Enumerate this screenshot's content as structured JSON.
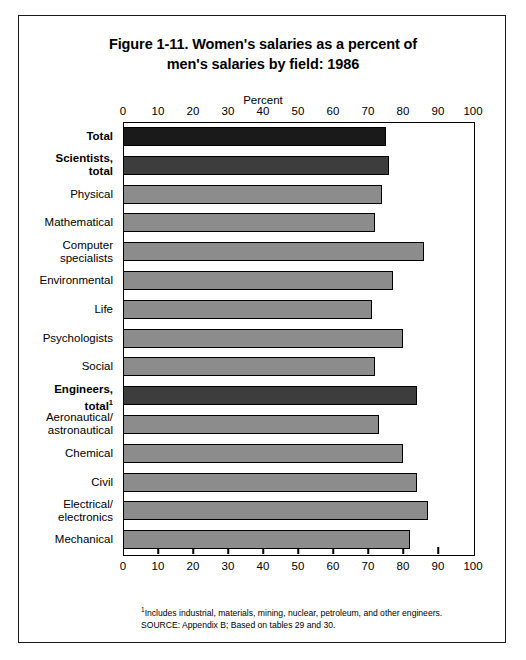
{
  "figure": {
    "title_line1": "Figure 1-11.  Women's salaries as a percent of",
    "title_line2": "men's salaries by field:  1986",
    "axis_caption": "Percent",
    "footnote_marker": "1",
    "footnote": "Includes industrial, materials, mining, nuclear, petroleum, and other engineers.",
    "source": "SOURCE:  Appendix B; Based on tables 29 and 30."
  },
  "colors": {
    "total_bar": "#1a1a1a",
    "subtotal_bar": "#3d3d3d",
    "detail_bar": "#8c8c8c",
    "axis": "#000000",
    "background": "#ffffff"
  },
  "chart_data": {
    "type": "bar",
    "orientation": "horizontal",
    "title": "Figure 1-11.  Women's salaries as a percent of men's salaries by field:  1986",
    "xlabel": "Percent",
    "ylabel": "",
    "xlim": [
      0,
      100
    ],
    "xticks": [
      0,
      10,
      20,
      30,
      40,
      50,
      60,
      70,
      80,
      90,
      100
    ],
    "tick_labels": [
      "0",
      "10",
      "20",
      "30",
      "40",
      "50",
      "60",
      "70",
      "80",
      "90",
      "100"
    ],
    "grid": false,
    "legend": "none",
    "categories": [
      "Total",
      "Scientists, total",
      "Physical",
      "Mathematical",
      "Computer specialists",
      "Environmental",
      "Life",
      "Psychologists",
      "Social",
      "Engineers, total",
      "Aeronautical/ astronautical",
      "Chemical",
      "Civil",
      "Electrical/ electronics",
      "Mechanical"
    ],
    "values": [
      75,
      76,
      74,
      72,
      86,
      77,
      71,
      80,
      72,
      84,
      73,
      80,
      84,
      87,
      82
    ]
  },
  "bars": [
    {
      "label_lines": [
        "Total"
      ],
      "value": 75,
      "style": "total",
      "bold": true
    },
    {
      "label_lines": [
        "Scientists,",
        "total"
      ],
      "value": 76,
      "style": "subtotal",
      "bold": true
    },
    {
      "label_lines": [
        "Physical"
      ],
      "value": 74,
      "style": "detail",
      "bold": false
    },
    {
      "label_lines": [
        "Mathematical"
      ],
      "value": 72,
      "style": "detail",
      "bold": false
    },
    {
      "label_lines": [
        "Computer",
        "specialists"
      ],
      "value": 86,
      "style": "detail",
      "bold": false
    },
    {
      "label_lines": [
        "Environmental"
      ],
      "value": 77,
      "style": "detail",
      "bold": false
    },
    {
      "label_lines": [
        "Life"
      ],
      "value": 71,
      "style": "detail",
      "bold": false
    },
    {
      "label_lines": [
        "Psychologists"
      ],
      "value": 80,
      "style": "detail",
      "bold": false
    },
    {
      "label_lines": [
        "Social"
      ],
      "value": 72,
      "style": "detail",
      "bold": false
    },
    {
      "label_lines": [
        "Engineers,",
        "total"
      ],
      "value": 84,
      "style": "subtotal",
      "bold": true,
      "superscript": "1"
    },
    {
      "label_lines": [
        "Aeronautical/",
        "astronautical"
      ],
      "value": 73,
      "style": "detail",
      "bold": false
    },
    {
      "label_lines": [
        "Chemical"
      ],
      "value": 80,
      "style": "detail",
      "bold": false
    },
    {
      "label_lines": [
        "Civil"
      ],
      "value": 84,
      "style": "detail",
      "bold": false
    },
    {
      "label_lines": [
        "Electrical/",
        "electronics"
      ],
      "value": 87,
      "style": "detail",
      "bold": false
    },
    {
      "label_lines": [
        "Mechanical"
      ],
      "value": 82,
      "style": "detail",
      "bold": false
    }
  ]
}
